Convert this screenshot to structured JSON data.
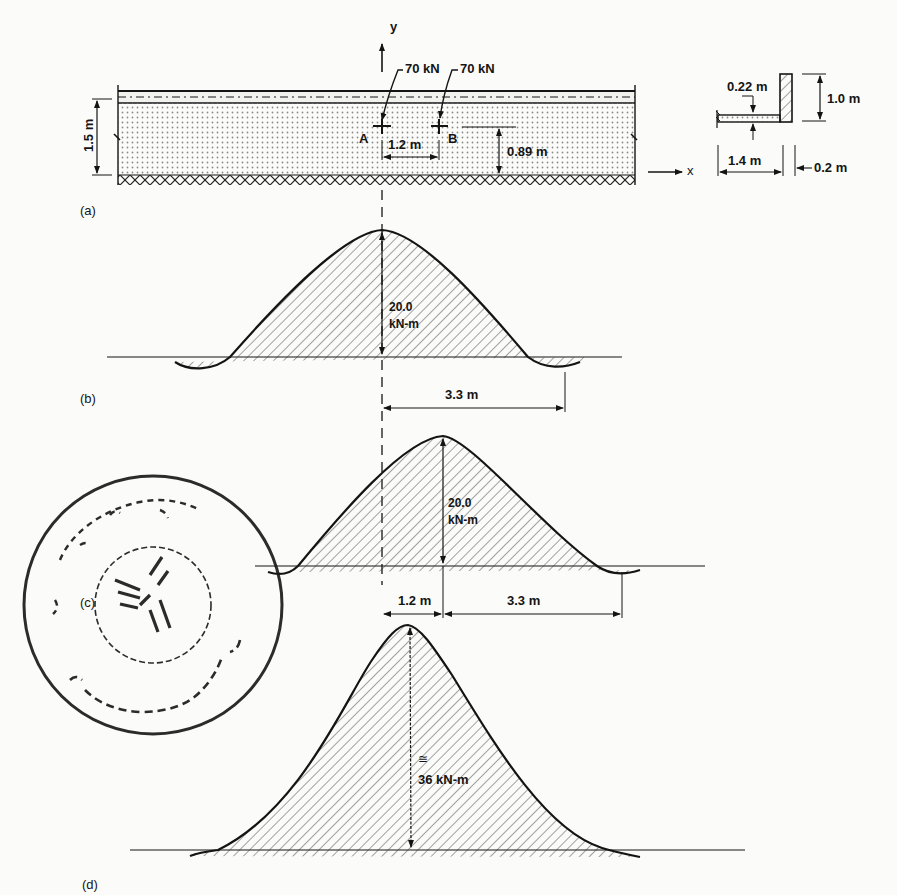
{
  "figure": {
    "panels": [
      {
        "id": "a",
        "label": "(a)"
      },
      {
        "id": "b",
        "label": "(b)"
      },
      {
        "id": "c",
        "label": "(c)"
      },
      {
        "id": "d",
        "label": "(d)"
      }
    ]
  },
  "panel_a": {
    "axis_y": "y",
    "axis_x": "x",
    "load_1": "70 kN",
    "load_2": "70 kN",
    "point_a": "A",
    "point_b": "B",
    "wheel_spacing": "1.2 m",
    "slab_thickness": "1.5 m",
    "load_depth": "0.89 m"
  },
  "curb_section": {
    "flange_thickness": "0.22 m",
    "curb_height": "1.0 m",
    "overhang_width": "1.4 m",
    "curb_width": "0.2 m"
  },
  "panel_b": {
    "peak_moment_value": "20.0",
    "peak_moment_unit": "kN-m",
    "half_width": "3.3 m"
  },
  "panel_c": {
    "peak_moment_value": "20.0",
    "peak_moment_unit": "kN-m",
    "offset": "1.2 m",
    "half_width": "3.3 m"
  },
  "panel_d": {
    "approx_symbol": "≅",
    "peak_moment": "36 kN-m"
  },
  "stamp": {
    "type": "circular library seal",
    "script": "Persian"
  },
  "colors": {
    "ink": "#141414",
    "paper": "#fbfbf9",
    "slab_dots": "#8a8a8a"
  }
}
